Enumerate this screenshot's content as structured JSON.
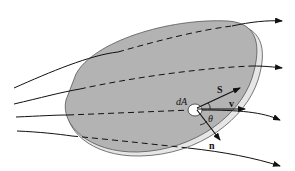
{
  "diagram": {
    "labels": {
      "area_element": "dA",
      "vector_s": "S",
      "vector_v": "v",
      "angle": "θ",
      "normal": "n"
    },
    "colors": {
      "surface_fill": "#b3b3b3",
      "surface_edge": "#555555",
      "surface_highlight": "#ffffff",
      "lines": "#111111",
      "background": "#ffffff"
    },
    "flow_lines": 4
  }
}
